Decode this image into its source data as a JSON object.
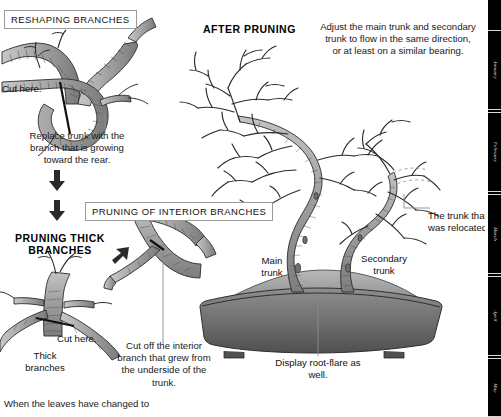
{
  "page": {
    "width": 501,
    "height": 415,
    "background": "#ffffff",
    "ink": "#1a1a1a"
  },
  "sections": {
    "reshaping": {
      "box_title": "RESHAPING BRANCHES",
      "cut_label": "Cut here.",
      "caption": "Replace trunk with the\nbranch that is growing\ntoward the rear.",
      "caption_line1": "Replace trunk with the",
      "caption_line2": "branch that is growing",
      "caption_line3": "toward the rear."
    },
    "thick_branches": {
      "heading_line1": "PRUNING THICK",
      "heading_line2": "BRANCHES",
      "cut_label": "Cut here.",
      "label_line1": "Thick",
      "label_line2": "branches"
    },
    "interior": {
      "box_title": "PRUNING OF INTERIOR BRANCHES",
      "caption_line1": "Cut off the interior",
      "caption_line2": "branch that grew from",
      "caption_line3": "the underside of the",
      "caption_line4": "trunk."
    },
    "after_pruning": {
      "heading": "AFTER PRUNING",
      "note_line1": "Adjust the main trunk and secondary",
      "note_line2": "trunk to flow in the same direction,",
      "note_line3": "or at least on a similar bearing.",
      "label_main_line1": "Main",
      "label_main_line2": "trunk",
      "label_secondary_line1": "Secondary",
      "label_secondary_line2": "trunk",
      "label_relocated_line1": "The trunk that",
      "label_relocated_line2": "was relocated.",
      "label_rootflare_line1": "Display root-flare as",
      "label_rootflare_line2": "well."
    },
    "footer": {
      "text": "When the leaves have changed to"
    }
  },
  "icons": {
    "arrow_down_1": "arrow-down-icon",
    "arrow_down_2": "arrow-down-icon",
    "arrow_diagonal": "arrow-up-right-icon"
  },
  "edge_rail": {
    "background": "#000000",
    "tabs": [
      {
        "label": "January"
      },
      {
        "label": "February"
      },
      {
        "label": "March"
      },
      {
        "label": "April"
      },
      {
        "label": "May"
      }
    ]
  },
  "colors": {
    "bark_fill": "#9c9c9c",
    "bark_fill_light": "#b5b5b5",
    "bark_line": "#2b2b2b",
    "pot_top": "#9a9a9a",
    "pot_body": "#6f6f6f",
    "pot_dark": "#4a4a4a",
    "leader_line": "#8d8d8d",
    "box_border": "#9a9a9a"
  }
}
